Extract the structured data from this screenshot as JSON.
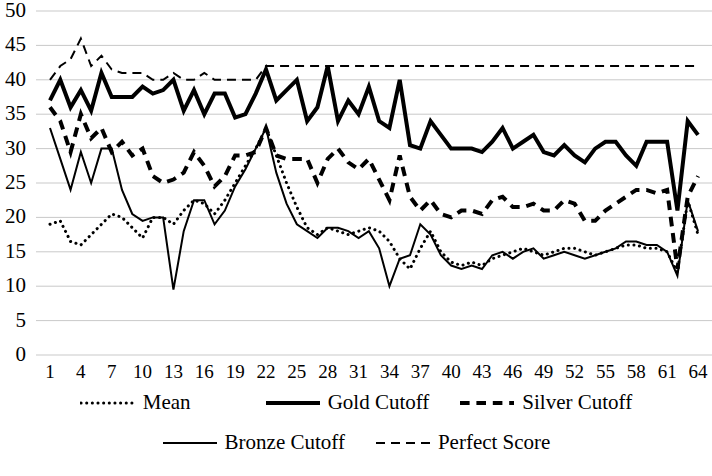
{
  "chart_data": {
    "type": "line",
    "title": "",
    "xlabel": "",
    "ylabel": "",
    "ylim": [
      0,
      50
    ],
    "xlim": [
      1,
      64
    ],
    "ytick_step": 5,
    "xtick_step": 3,
    "grid": true,
    "legend_position": "bottom",
    "yticks": [
      "50",
      "45",
      "40",
      "35",
      "30",
      "25",
      "20",
      "15",
      "10",
      "5",
      "0"
    ],
    "xticks": [
      "1",
      "4",
      "7",
      "10",
      "13",
      "16",
      "19",
      "22",
      "25",
      "28",
      "31",
      "34",
      "37",
      "40",
      "43",
      "46",
      "49",
      "52",
      "55",
      "58",
      "61",
      "64"
    ],
    "x": [
      1,
      2,
      3,
      4,
      5,
      6,
      7,
      8,
      9,
      10,
      11,
      12,
      13,
      14,
      15,
      16,
      17,
      18,
      19,
      20,
      21,
      22,
      23,
      24,
      25,
      26,
      27,
      28,
      29,
      30,
      31,
      32,
      33,
      34,
      35,
      36,
      37,
      38,
      39,
      40,
      41,
      42,
      43,
      44,
      45,
      46,
      47,
      48,
      49,
      50,
      51,
      52,
      53,
      54,
      55,
      56,
      57,
      58,
      59,
      60,
      61,
      62,
      63,
      64
    ],
    "series": [
      {
        "name": "Mean",
        "style": "dotted",
        "width": 3,
        "color": "#000000",
        "values": [
          19.0,
          19.5,
          16.5,
          16.0,
          17.5,
          19.0,
          20.5,
          20.0,
          18.5,
          17.0,
          20.0,
          20.0,
          19.0,
          21.0,
          22.5,
          22.0,
          20.5,
          22.5,
          25.0,
          27.5,
          30.0,
          33.0,
          29.0,
          25.0,
          21.5,
          18.5,
          17.5,
          18.5,
          18.0,
          17.5,
          18.0,
          18.5,
          18.0,
          16.5,
          14.0,
          12.5,
          15.5,
          18.0,
          15.0,
          13.5,
          13.0,
          13.5,
          13.0,
          14.0,
          14.5,
          15.0,
          15.5,
          15.0,
          14.5,
          15.0,
          15.5,
          15.5,
          15.0,
          14.5,
          15.0,
          15.5,
          16.0,
          16.0,
          15.5,
          15.5,
          15.0,
          12.0,
          22.5,
          17.5
        ]
      },
      {
        "name": "Gold Cutoff",
        "style": "solid",
        "width": 4,
        "color": "#000000",
        "values": [
          37.0,
          40.0,
          36.0,
          38.5,
          35.5,
          41.0,
          37.5,
          37.5,
          37.5,
          39.0,
          38.0,
          38.5,
          40.0,
          35.5,
          38.5,
          35.0,
          38.0,
          38.0,
          34.5,
          35.0,
          38.0,
          41.5,
          37.0,
          38.5,
          40.0,
          34.0,
          36.0,
          42.0,
          34.0,
          37.0,
          35.0,
          39.0,
          34.0,
          33.0,
          40.0,
          30.5,
          30.0,
          34.0,
          32.0,
          30.0,
          30.0,
          30.0,
          29.5,
          31.0,
          33.0,
          30.0,
          31.0,
          32.0,
          29.5,
          29.0,
          30.5,
          29.0,
          28.0,
          30.0,
          31.0,
          31.0,
          29.0,
          27.5,
          31.0,
          31.0,
          31.0,
          21.0,
          34.0,
          32.0
        ]
      },
      {
        "name": "Silver Cutoff",
        "style": "dashed-thick",
        "width": 4,
        "color": "#000000",
        "values": [
          36.0,
          34.0,
          29.5,
          35.0,
          31.5,
          33.0,
          29.5,
          31.0,
          29.0,
          30.0,
          26.0,
          25.0,
          25.5,
          26.5,
          29.5,
          27.5,
          24.5,
          26.0,
          29.0,
          29.0,
          29.5,
          33.0,
          29.0,
          28.5,
          28.5,
          28.5,
          25.0,
          28.5,
          30.0,
          28.0,
          27.0,
          28.5,
          25.5,
          22.5,
          29.0,
          23.0,
          21.0,
          22.5,
          20.5,
          20.0,
          21.0,
          21.0,
          20.5,
          22.5,
          23.0,
          21.5,
          21.5,
          22.0,
          21.0,
          21.0,
          22.5,
          22.0,
          19.5,
          19.5,
          21.0,
          22.0,
          23.0,
          24.0,
          24.0,
          23.5,
          24.0,
          12.5,
          23.0,
          26.0
        ]
      },
      {
        "name": "Bronze Cutoff",
        "style": "solid-thin",
        "width": 2,
        "color": "#000000",
        "values": [
          33.0,
          28.5,
          24.0,
          29.5,
          25.0,
          30.0,
          30.0,
          24.0,
          20.5,
          19.5,
          20.0,
          20.0,
          9.5,
          18.0,
          22.5,
          22.5,
          19.0,
          21.0,
          24.5,
          27.0,
          30.0,
          33.0,
          26.5,
          22.0,
          19.0,
          18.0,
          17.0,
          18.5,
          18.5,
          18.0,
          17.0,
          18.0,
          15.5,
          10.0,
          14.0,
          14.5,
          19.0,
          17.5,
          14.5,
          13.0,
          12.5,
          13.0,
          12.5,
          14.5,
          15.0,
          14.0,
          15.0,
          15.5,
          14.0,
          14.5,
          15.0,
          14.5,
          14.0,
          14.5,
          15.0,
          15.5,
          16.5,
          16.5,
          16.0,
          16.0,
          15.0,
          11.5,
          22.5,
          18.0
        ]
      },
      {
        "name": "Perfect Score",
        "style": "dashed-thin",
        "width": 2,
        "color": "#000000",
        "values": [
          40.0,
          42.0,
          43.0,
          46.0,
          42.0,
          43.5,
          41.5,
          41.0,
          41.0,
          41.0,
          40.0,
          40.0,
          41.0,
          40.0,
          40.0,
          41.0,
          40.0,
          40.0,
          40.0,
          40.0,
          40.0,
          42.0,
          42.0,
          42.0,
          42.0,
          42.0,
          42.0,
          42.0,
          42.0,
          42.0,
          42.0,
          42.0,
          42.0,
          42.0,
          42.0,
          42.0,
          42.0,
          42.0,
          42.0,
          42.0,
          42.0,
          42.0,
          42.0,
          42.0,
          42.0,
          42.0,
          42.0,
          42.0,
          42.0,
          42.0,
          42.0,
          42.0,
          42.0,
          42.0,
          42.0,
          42.0,
          42.0,
          42.0,
          42.0,
          42.0,
          42.0,
          42.0,
          42.0,
          42.0
        ]
      }
    ]
  },
  "legend": {
    "entries": [
      {
        "label": "Mean",
        "style": "dotted"
      },
      {
        "label": "Gold Cutoff",
        "style": "solid"
      },
      {
        "label": "Silver Cutoff",
        "style": "dashed-thick"
      },
      {
        "label": "Bronze Cutoff",
        "style": "solid-thin"
      },
      {
        "label": "Perfect Score",
        "style": "dashed-thin"
      }
    ]
  },
  "colors": {
    "ink": "#000000",
    "grid": "#c9c9c9",
    "background": "#ffffff"
  }
}
